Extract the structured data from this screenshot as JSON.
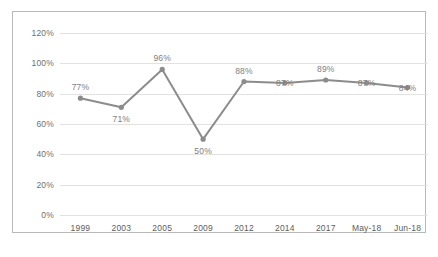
{
  "chart_data": {
    "type": "line",
    "title": "",
    "xlabel": "",
    "ylabel": "",
    "categories": [
      "1999",
      "2003",
      "2005",
      "2009",
      "2012",
      "2014",
      "2017",
      "May-18",
      "Jun-18"
    ],
    "values": [
      77,
      71,
      96,
      50,
      88,
      87,
      89,
      87,
      84
    ],
    "point_labels": [
      "77%",
      "71%",
      "96%",
      "50%",
      "88%",
      "87%",
      "89%",
      "87%",
      "84%"
    ],
    "label_positions": [
      "above",
      "below",
      "above",
      "below",
      "above",
      "overlap",
      "above",
      "overlap",
      "overlap"
    ],
    "ylim": [
      0,
      120
    ],
    "ytick_values": [
      0,
      20,
      40,
      60,
      80,
      100,
      120
    ],
    "ytick_labels": [
      "0%",
      "20%",
      "40%",
      "60%",
      "80%",
      "100%",
      "120%"
    ],
    "grid": true,
    "legend": "none",
    "series_color": "#8c8c8c",
    "marker_color": "#8c8c8c",
    "gridline_color": "#e2e2e2",
    "label_color": "#808080",
    "frame_color": "#b9b9b9"
  }
}
